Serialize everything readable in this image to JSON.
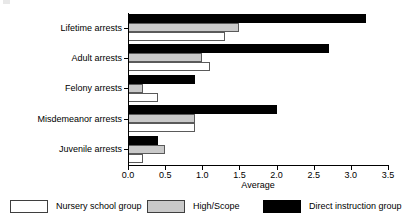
{
  "chart_data": {
    "type": "bar",
    "orientation": "horizontal",
    "title": "",
    "xlabel": "Average",
    "ylabel": "",
    "xlim": [
      0.0,
      3.5
    ],
    "xticks": [
      "0.0",
      "0.5",
      "1.0",
      "1.5",
      "2.0",
      "2.5",
      "3.0",
      "3.5"
    ],
    "xtick_values": [
      0.0,
      0.5,
      1.0,
      1.5,
      2.0,
      2.5,
      3.0,
      3.5
    ],
    "grid": false,
    "legend_position": "bottom",
    "categories": [
      "Lifetime arrests",
      "Adult arrests",
      "Felony arrests",
      "Misdemeanor arrests",
      "Juvenile arrests"
    ],
    "series": [
      {
        "name": "Nursery school group",
        "color": "#ffffff",
        "values": [
          1.3,
          1.1,
          0.4,
          0.9,
          0.2
        ]
      },
      {
        "name": "High/Scope",
        "color": "#c9c9c9",
        "values": [
          1.5,
          1.0,
          0.2,
          0.9,
          0.5
        ]
      },
      {
        "name": "Direct instruction group",
        "color": "#000000",
        "values": [
          3.2,
          2.7,
          0.9,
          2.0,
          0.4
        ]
      }
    ]
  },
  "legend": {
    "items": [
      {
        "label": "Nursery school group",
        "swatch": "white"
      },
      {
        "label": "High/Scope",
        "swatch": "gray"
      },
      {
        "label": "Direct instruction group",
        "swatch": "black"
      }
    ]
  }
}
